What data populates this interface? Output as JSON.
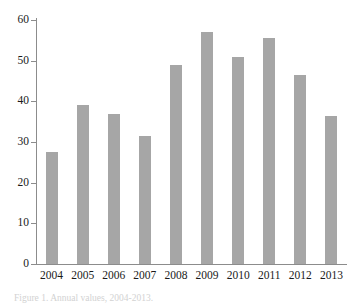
{
  "figure": {
    "caption": "Figure 1. Annual values, 2004-2013."
  },
  "chart_data": {
    "type": "bar",
    "title": "",
    "subtitle": "",
    "xlabel": "",
    "ylabel": "",
    "categories": [
      "2004",
      "2005",
      "2006",
      "2007",
      "2008",
      "2009",
      "2010",
      "2011",
      "2012",
      "2013"
    ],
    "values": [
      27.5,
      39.0,
      37.0,
      31.5,
      49.0,
      57.0,
      51.0,
      55.5,
      46.5,
      36.5
    ],
    "series": [
      {
        "name": "value",
        "values": [
          27.5,
          39.0,
          37.0,
          31.5,
          49.0,
          57.0,
          51.0,
          55.5,
          46.5,
          36.5
        ]
      }
    ],
    "ylim": [
      0,
      60
    ],
    "yticks": [
      0,
      10,
      20,
      30,
      40,
      50,
      60
    ],
    "ytick_labels": [
      "0",
      "10",
      "20",
      "30",
      "40",
      "50",
      "60"
    ],
    "xtick_labels": [
      "2004",
      "2005",
      "2006",
      "2007",
      "2008",
      "2009",
      "2010",
      "2011",
      "2012",
      "2013"
    ],
    "grid": false,
    "legend": false,
    "legend_position": "none",
    "bar_color": "#a6a6a6",
    "axis_color": "#8c8c8c",
    "background": "#ffffff",
    "annotations": []
  }
}
